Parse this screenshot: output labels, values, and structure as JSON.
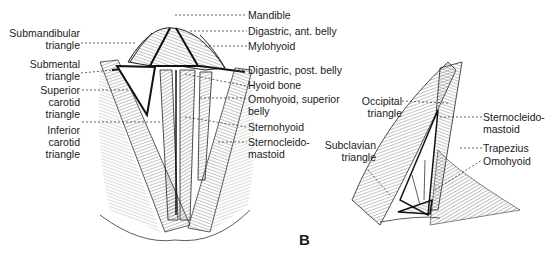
{
  "figure": {
    "panel_letter": "B",
    "left_view": {
      "left_labels": [
        {
          "line1": "Submandibular",
          "line2": "triangle"
        },
        {
          "line1": "Submental",
          "line2": "triangle"
        },
        {
          "line1": "Superior",
          "line2": "carotid",
          "line3": "triangle"
        },
        {
          "line1": "Inferior",
          "line2": "carotid",
          "line3": "triangle"
        }
      ],
      "right_labels": [
        {
          "line1": "Mandible"
        },
        {
          "line1": "Digastric, ant. belly"
        },
        {
          "line1": "Mylohyoid"
        },
        {
          "line1": "Digastric, post. belly"
        },
        {
          "line1": "Hyoid bone"
        },
        {
          "line1": "Omohyoid, superior",
          "line2": "belly"
        },
        {
          "line1": "Sternohyoid"
        },
        {
          "line1": "Sternocleido-",
          "line2": "mastoid"
        }
      ]
    },
    "right_view": {
      "left_labels": [
        {
          "line1": "Occipital",
          "line2": "triangle"
        },
        {
          "line1": "Subclavian",
          "line2": "triangle"
        }
      ],
      "right_labels": [
        {
          "line1": "Sternocleido-",
          "line2": "mastoid"
        },
        {
          "line1": "Trapezius"
        },
        {
          "line1": "Omohyoid"
        }
      ]
    }
  }
}
